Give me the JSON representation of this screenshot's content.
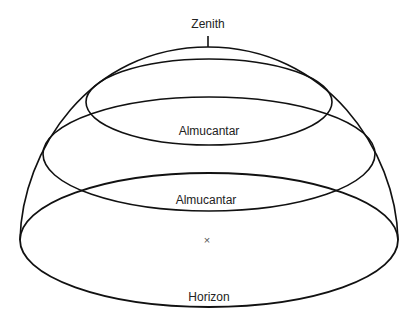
{
  "diagram": {
    "colors": {
      "line": "#111111",
      "text": "#222222",
      "background": "#ffffff"
    },
    "labels": {
      "zenith": "Zenith",
      "almucantar_upper": "Almucantar",
      "almucantar_lower": "Almucantar",
      "horizon": "Horizon",
      "observer_mark": "×"
    },
    "shapes": {
      "dome": {
        "left_x": 20,
        "right_x": 398,
        "base_y": 240,
        "top_y": 47
      },
      "zenith_tick": {
        "x": 208,
        "y1": 36,
        "y2": 47
      },
      "almucantar_upper": {
        "cx": 209,
        "cy": 102,
        "rx": 123,
        "ry": 43
      },
      "almucantar_lower": {
        "cx": 209,
        "cy": 154,
        "rx": 166,
        "ry": 57
      },
      "horizon": {
        "cx": 209,
        "cy": 240,
        "rx": 189,
        "ry": 67
      }
    }
  }
}
